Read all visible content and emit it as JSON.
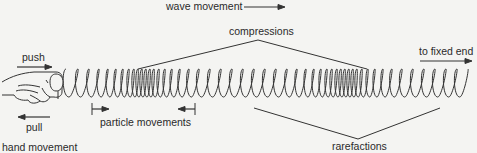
{
  "labels": {
    "wave_movement": "wave movement",
    "compressions": "compressions",
    "to_fixed_end": "to fixed end",
    "push": "push",
    "pull": "pull",
    "particle_movements": "particle movements",
    "hand_movement": "hand movement",
    "rarefactions": "rarefactions"
  },
  "colors": {
    "line": "#333333",
    "background": "#f4f4f2"
  },
  "spring": {
    "start_x": 66,
    "end_x": 468,
    "center_y": 83,
    "loop_half_height": 14,
    "coil_positions": [
      66,
      78,
      89,
      99,
      108,
      116,
      123,
      129,
      134,
      138,
      142,
      146,
      150,
      154,
      159,
      165,
      172,
      180,
      189,
      199,
      210,
      221,
      232,
      243,
      254,
      265,
      276,
      287,
      297,
      306,
      314,
      321,
      327,
      332,
      337,
      341,
      345,
      349,
      353,
      357,
      362,
      368,
      375,
      383,
      392,
      402,
      413,
      424,
      435,
      446,
      457,
      468
    ]
  },
  "icons": [
    "hand-icon",
    "push-arrow-icon",
    "pull-arrow-icon",
    "wave-arrow-icon",
    "fixed-end-arrow-icon",
    "particle-left-arrow-icon",
    "particle-right-arrow-icon"
  ]
}
